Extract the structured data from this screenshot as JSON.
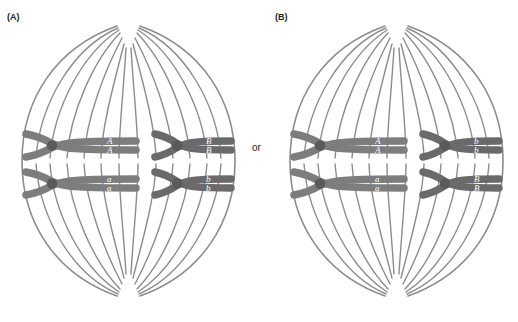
{
  "figure": {
    "connector": {
      "label": "or"
    },
    "colors": {
      "background": "#ffffff",
      "cell_outline": "#8c8c8c",
      "spindle_fiber": "#8c8c8c",
      "chromosome_light": "#7d7d7d",
      "chromosome_dark": "#6a6a6a",
      "centromere": "#5a5a5a",
      "label_text": "#231f20",
      "allele_text": "#ffffff"
    }
  },
  "panels": [
    {
      "id": "A",
      "label": "(A)",
      "chromosomes": [
        {
          "position": "top-left",
          "allele_top": "A",
          "allele_bottom": "A",
          "size": "long",
          "shade": "light"
        },
        {
          "position": "top-right",
          "allele_top": "B",
          "allele_bottom": "B",
          "size": "short",
          "shade": "dark"
        },
        {
          "position": "bottom-left",
          "allele_top": "a",
          "allele_bottom": "a",
          "size": "long",
          "shade": "light"
        },
        {
          "position": "bottom-right",
          "allele_top": "b",
          "allele_bottom": "b",
          "size": "short",
          "shade": "dark"
        }
      ]
    },
    {
      "id": "B",
      "label": "(B)",
      "chromosomes": [
        {
          "position": "top-left",
          "allele_top": "A",
          "allele_bottom": "A",
          "size": "long",
          "shade": "light"
        },
        {
          "position": "top-right",
          "allele_top": "b",
          "allele_bottom": "b",
          "size": "short",
          "shade": "dark"
        },
        {
          "position": "bottom-left",
          "allele_top": "a",
          "allele_bottom": "a",
          "size": "long",
          "shade": "light"
        },
        {
          "position": "bottom-right",
          "allele_top": "B",
          "allele_bottom": "B",
          "size": "short",
          "shade": "dark"
        }
      ]
    }
  ]
}
